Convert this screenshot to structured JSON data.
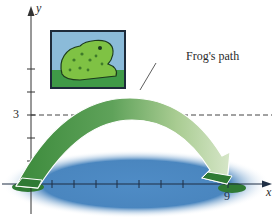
{
  "diagram": {
    "axes": {
      "x_label": "x",
      "y_label": "y",
      "x_tick_label": "9",
      "y_tick_label": "3"
    },
    "annotation": {
      "path_label": "Frog's path"
    },
    "illustration": {
      "subject": "frog-picture",
      "pond": "pond-ellipse"
    },
    "colors": {
      "pond": "#4a86bf",
      "arc_dark": "#3f8a3f",
      "arc_light": "#c9dfb6",
      "axis": "#333333",
      "frog_bg": "#8bbbd9",
      "frog_body": "#6fb53a"
    }
  }
}
